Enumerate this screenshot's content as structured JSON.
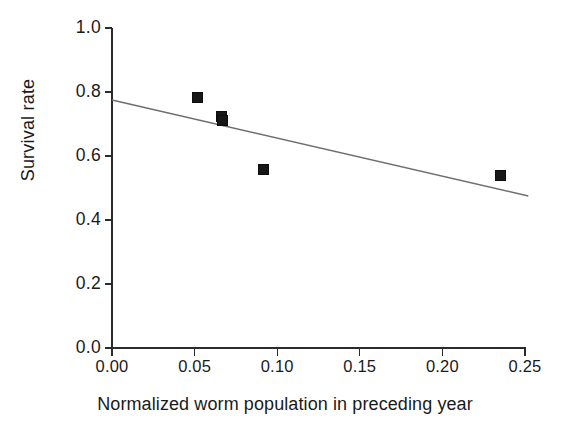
{
  "chart_data": {
    "type": "scatter",
    "title": "",
    "xlabel": "Normalized worm population in preceding year",
    "ylabel": "Survival rate",
    "xlim": [
      0.0,
      0.25
    ],
    "ylim": [
      0.0,
      1.0
    ],
    "xticks": [
      0.0,
      0.05,
      0.1,
      0.15,
      0.2,
      0.25
    ],
    "xtick_labels": [
      "0.00",
      "0.05",
      "0.10",
      "0.15",
      "0.20",
      "0.25"
    ],
    "yticks": [
      0.0,
      0.2,
      0.4,
      0.6,
      0.8,
      1.0
    ],
    "ytick_labels": [
      "0.0",
      "0.2",
      "0.4",
      "0.6",
      "0.8",
      "1.0"
    ],
    "grid": false,
    "legend": null,
    "marker": "square",
    "marker_color": "#171717",
    "points": [
      {
        "x": 0.052,
        "y": 0.782
      },
      {
        "x": 0.066,
        "y": 0.724
      },
      {
        "x": 0.067,
        "y": 0.712
      },
      {
        "x": 0.092,
        "y": 0.559
      },
      {
        "x": 0.235,
        "y": 0.539
      }
    ],
    "series": [
      {
        "name": "observations",
        "type": "scatter",
        "x": [
          0.052,
          0.066,
          0.067,
          0.092,
          0.235
        ],
        "y": [
          0.782,
          0.724,
          0.712,
          0.559,
          0.539
        ]
      },
      {
        "name": "regression-line",
        "type": "line",
        "color": "#6e6e6e",
        "x": [
          0.0,
          0.252
        ],
        "y": [
          0.775,
          0.475
        ]
      }
    ],
    "trendline": {
      "x_start": 0.0,
      "y_start": 0.775,
      "x_end": 0.252,
      "y_end": 0.475,
      "slope": -1.19,
      "intercept": 0.775
    }
  },
  "axes": {
    "y_title": "Survival rate",
    "x_title": "Normalized worm population in preceding year"
  }
}
